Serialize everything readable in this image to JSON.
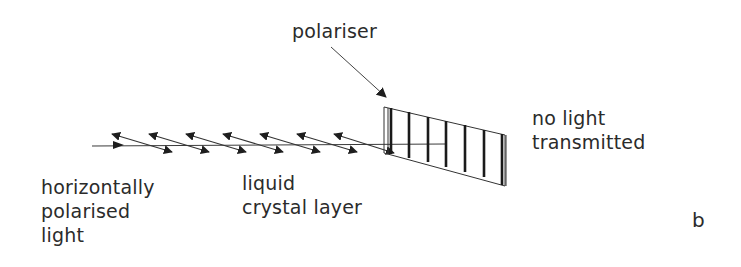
{
  "figure": {
    "panel_label": "b",
    "labels": {
      "polariser": "polariser",
      "no_light": [
        "no light",
        "transmitted"
      ],
      "input_light": [
        "horizontally",
        "polarised",
        "light"
      ],
      "liquid_crystal": [
        "liquid",
        "crystal layer"
      ]
    },
    "elements": {
      "incoming_ray": "horizontal light ray",
      "crystal_arrows_count": 7,
      "polariser_vertical_lines": 7
    },
    "colors": {
      "ink": "#2a2a2a",
      "background": "#ffffff"
    }
  }
}
